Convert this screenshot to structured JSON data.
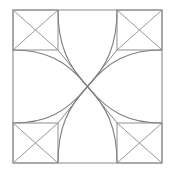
{
  "figure": {
    "background_color": "#ffffff",
    "stroke_color": "#8a8a8a",
    "canvas": {
      "width": 175,
      "height": 174
    },
    "frame": {
      "label": "outer-square",
      "x1": 13,
      "y1": 10,
      "x2": 162,
      "y2": 163
    },
    "center": {
      "x": 87.5,
      "y": 86.5
    },
    "grid": {
      "label": "sub-square-guides",
      "left": 13,
      "right": 162,
      "top": 10,
      "bottom": 163,
      "inner_left": 58,
      "inner_right": 117,
      "inner_top": 50,
      "inner_bottom": 123
    },
    "cells": [
      {
        "name": "top-left-cell",
        "x1": 13,
        "y1": 10,
        "x2": 58,
        "y2": 50,
        "corner_x": 58,
        "corner_y": 50
      },
      {
        "name": "top-right-cell",
        "x1": 117,
        "y1": 10,
        "x2": 162,
        "y2": 50,
        "corner_x": 117,
        "corner_y": 50
      },
      {
        "name": "bottom-left-cell",
        "x1": 13,
        "y1": 123,
        "x2": 58,
        "y2": 163,
        "corner_x": 58,
        "corner_y": 123
      },
      {
        "name": "bottom-right-cell",
        "x1": 117,
        "y1": 123,
        "x2": 162,
        "y2": 163,
        "corner_x": 117,
        "corner_y": 123
      }
    ],
    "arcs": [
      {
        "name": "arc-top-left-vertical",
        "d": "M 58 10 C 58 45, 68 66, 87.5 86.5"
      },
      {
        "name": "arc-top-left-horizontal",
        "d": "M 13 50 C 45 50, 66 60, 87.5 86.5"
      },
      {
        "name": "arc-top-right-vertical",
        "d": "M 117 10 C 117 45, 107 66, 87.5 86.5"
      },
      {
        "name": "arc-top-right-horizontal",
        "d": "M 162 50 C 130 50, 109 60, 87.5 86.5"
      },
      {
        "name": "arc-bottom-left-vertical",
        "d": "M 58 163 C 58 128, 68 107, 87.5 86.5"
      },
      {
        "name": "arc-bottom-left-horizontal",
        "d": "M 13 123 C 45 123, 66 113, 87.5 86.5"
      },
      {
        "name": "arc-bottom-right-vertical",
        "d": "M 117 163 C 117 128, 107 107, 87.5 86.5"
      },
      {
        "name": "arc-bottom-right-horizontal",
        "d": "M 162 123 C 130 123, 109 113, 87.5 86.5"
      }
    ],
    "spokes": [
      {
        "name": "spoke-top-left",
        "x1": 58,
        "y1": 50,
        "x2": 87.5,
        "y2": 86.5
      },
      {
        "name": "spoke-top-right",
        "x1": 117,
        "y1": 50,
        "x2": 87.5,
        "y2": 86.5
      },
      {
        "name": "spoke-bottom-left",
        "x1": 58,
        "y1": 123,
        "x2": 87.5,
        "y2": 86.5
      },
      {
        "name": "spoke-bottom-right",
        "x1": 117,
        "y1": 123,
        "x2": 87.5,
        "y2": 86.5
      }
    ]
  }
}
